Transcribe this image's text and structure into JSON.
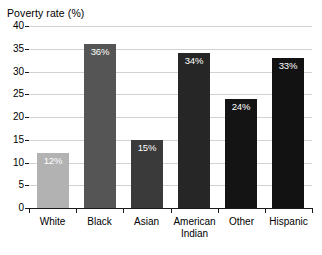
{
  "chart_data": {
    "type": "bar",
    "title": "Poverty rate (%)",
    "xlabel": "",
    "ylabel": "Poverty rate (%)",
    "ylim": [
      0,
      40
    ],
    "ytick_labels": [
      "0",
      "5",
      "10",
      "15",
      "20",
      "25",
      "30",
      "35",
      "40"
    ],
    "ytick_values": [
      0,
      5,
      10,
      15,
      20,
      25,
      30,
      35,
      40
    ],
    "grid": true,
    "legend": "none",
    "categories": [
      "White",
      "Black",
      "Asian",
      "American Indian",
      "Other",
      "Hispanic"
    ],
    "values": [
      12,
      36,
      15,
      34,
      24,
      33
    ],
    "data_labels": [
      "12%",
      "36%",
      "15%",
      "34%",
      "24%",
      "33%"
    ],
    "bars": [
      {
        "category": "White",
        "label_lines": [
          "White"
        ],
        "value": 12,
        "data_label": "12%",
        "color": "#b2b2b2"
      },
      {
        "category": "Black",
        "label_lines": [
          "Black"
        ],
        "value": 36,
        "data_label": "36%",
        "color": "#555555"
      },
      {
        "category": "Asian",
        "label_lines": [
          "Asian"
        ],
        "value": 15,
        "data_label": "15%",
        "color": "#3a3a3a"
      },
      {
        "category": "American Indian",
        "label_lines": [
          "American",
          "Indian"
        ],
        "value": 34,
        "data_label": "34%",
        "color": "#262626"
      },
      {
        "category": "Other",
        "label_lines": [
          "Other"
        ],
        "value": 24,
        "data_label": "24%",
        "color": "#141414"
      },
      {
        "category": "Hispanic",
        "label_lines": [
          "Hispanic"
        ],
        "value": 33,
        "data_label": "33%",
        "color": "#121212"
      }
    ]
  },
  "colors": {
    "background": "#ffffff",
    "axis": "#1a1a1a",
    "gridline": "#d2d2d2",
    "data_label_text": "#ffffff",
    "tick_text": "#000000"
  }
}
